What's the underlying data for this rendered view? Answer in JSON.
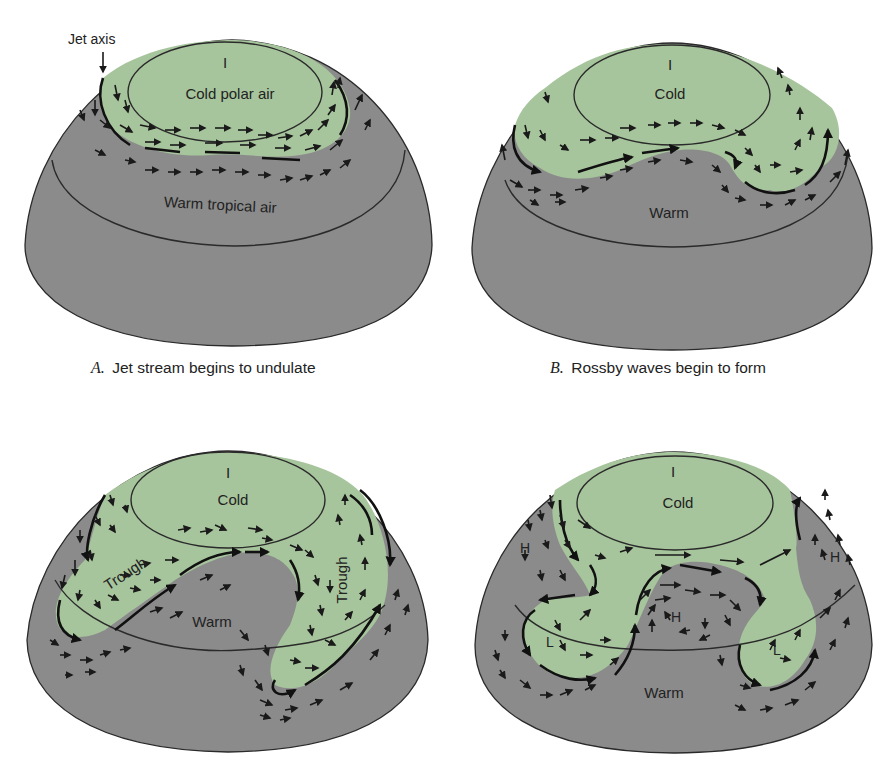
{
  "figure": {
    "colors": {
      "warm_gray": "#8b8b8b",
      "cold_green": "#a7c59c",
      "ink": "#1f1f1f",
      "background": "#ffffff"
    },
    "annotations": {
      "jet_axis": "Jet axis"
    },
    "panels": [
      {
        "id": "A",
        "caption_letter": "A.",
        "caption_text": "Jet stream begins to undulate",
        "labels": {
          "pole_mark": "I",
          "cold": "Cold polar air",
          "warm": "Warm tropical air"
        }
      },
      {
        "id": "B",
        "caption_letter": "B.",
        "caption_text": "Rossby waves begin to form",
        "labels": {
          "pole_mark": "I",
          "cold": "Cold",
          "warm": "Warm"
        }
      },
      {
        "id": "C",
        "caption_letter": "",
        "caption_text": "",
        "labels": {
          "pole_mark": "I",
          "cold": "Cold",
          "warm": "Warm",
          "trough_left": "Trough",
          "trough_right": "Trough"
        }
      },
      {
        "id": "D",
        "caption_letter": "",
        "caption_text": "",
        "labels": {
          "pole_mark": "I",
          "cold": "Cold",
          "warm": "Warm",
          "high_left": "H",
          "high_center": "H",
          "high_right": "H",
          "low_left": "L",
          "low_right": "L"
        }
      }
    ]
  }
}
